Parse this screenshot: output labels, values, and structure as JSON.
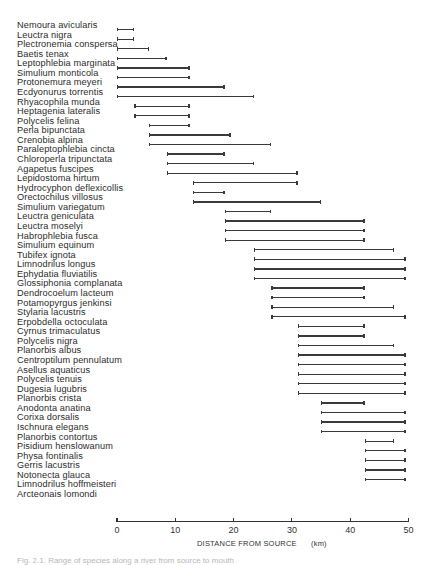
{
  "chart_data": {
    "type": "range-bar",
    "title": "",
    "xlabel": "DISTANCE FROM SOURCE",
    "xunit": "(km)",
    "xlim": [
      0,
      50
    ],
    "xticks": [
      0,
      10,
      20,
      30,
      40,
      50
    ],
    "grid": false,
    "legend": null,
    "series": [
      {
        "name": "Nemoura avicularis",
        "start": 0,
        "end": 3
      },
      {
        "name": "Leuctra nigra",
        "start": 0,
        "end": 3
      },
      {
        "name": "Plectronemia conspersa",
        "start": 0,
        "end": 5.5
      },
      {
        "name": "Baetis tenax",
        "start": 0,
        "end": 8.5
      },
      {
        "name": "Leptophlebia marginata",
        "start": 0,
        "end": 12.5
      },
      {
        "name": "Simulium monticola",
        "start": 0,
        "end": 12.5
      },
      {
        "name": "Protonemura meyeri",
        "start": 0,
        "end": 18.5
      },
      {
        "name": "Ecdyonurus torrentis",
        "start": 0,
        "end": 23.5
      },
      {
        "name": "Rhyacophila munda",
        "start": 3,
        "end": 12.5
      },
      {
        "name": "Heptagenia lateralis",
        "start": 3,
        "end": 12.5
      },
      {
        "name": "Polycelis felina",
        "start": 5.5,
        "end": 12.5
      },
      {
        "name": "Perla bipunctata",
        "start": 5.5,
        "end": 19.5
      },
      {
        "name": "Crenobia alpina",
        "start": 5.5,
        "end": 26.5
      },
      {
        "name": "Paraleptophlebia cincta",
        "start": 8.5,
        "end": 18.5
      },
      {
        "name": "Chloroperla tripunctata",
        "start": 8.5,
        "end": 23.5
      },
      {
        "name": "Agapetus fuscipes",
        "start": 8.5,
        "end": 31
      },
      {
        "name": "Lepidostoma hirtum",
        "start": 13,
        "end": 31
      },
      {
        "name": "Hydrocyphon deflexicollis",
        "start": 13,
        "end": 18.5
      },
      {
        "name": "Orectochilus villosus",
        "start": 13,
        "end": 35
      },
      {
        "name": "Simulium variegatum",
        "start": 18.5,
        "end": 26.5
      },
      {
        "name": "Leuctra geniculata",
        "start": 18.5,
        "end": 42.5
      },
      {
        "name": "Leuctra moselyi",
        "start": 18.5,
        "end": 42.5
      },
      {
        "name": "Habrophlebia fusca",
        "start": 18.5,
        "end": 42.5
      },
      {
        "name": "Simulium equinum",
        "start": 23.5,
        "end": 47.5
      },
      {
        "name": "Tubifex ignota",
        "start": 23.5,
        "end": 49.5
      },
      {
        "name": "Limnodrilus longus",
        "start": 23.5,
        "end": 49.5
      },
      {
        "name": "Ephydatia fluviatilis",
        "start": 23.5,
        "end": 49.5
      },
      {
        "name": "Glossiphonia complanata",
        "start": 26.5,
        "end": 42.5
      },
      {
        "name": "Dendrocoelum lacteum",
        "start": 26.5,
        "end": 42.5
      },
      {
        "name": "Potamopyrgus jenkinsi",
        "start": 26.5,
        "end": 47.5
      },
      {
        "name": "Stylaria lacustris",
        "start": 26.5,
        "end": 49.5
      },
      {
        "name": "Erpobdella octoculata",
        "start": 31,
        "end": 42.5
      },
      {
        "name": "Cyrnus trimaculatus",
        "start": 31,
        "end": 42.5
      },
      {
        "name": "Polycelis nigra",
        "start": 31,
        "end": 47.5
      },
      {
        "name": "Planorbis albus",
        "start": 31,
        "end": 49.5
      },
      {
        "name": "Centroptilum pennulatum",
        "start": 31,
        "end": 49.5
      },
      {
        "name": "Asellus aquaticus",
        "start": 31,
        "end": 49.5
      },
      {
        "name": "Polycelis tenuis",
        "start": 31,
        "end": 49.5
      },
      {
        "name": "Dugesia lugubris",
        "start": 31,
        "end": 49.5
      },
      {
        "name": "Planorbis crista",
        "start": 35,
        "end": 42.5
      },
      {
        "name": "Anodonta anatina",
        "start": 35,
        "end": 49.5
      },
      {
        "name": "Corixa dorsalis",
        "start": 35,
        "end": 49.5
      },
      {
        "name": "Ischnura elegans",
        "start": 35,
        "end": 49.5
      },
      {
        "name": "Planorbis contortus",
        "start": 42.5,
        "end": 47.5
      },
      {
        "name": "Pisidium henslowanum",
        "start": 42.5,
        "end": 49.5
      },
      {
        "name": "Physa fontinalis",
        "start": 42.5,
        "end": 49.5
      },
      {
        "name": "Gerris lacustris",
        "start": 42.5,
        "end": 49.5
      },
      {
        "name": "Notonecta glauca",
        "start": 42.5,
        "end": 49.5
      },
      {
        "name": "Limnodrilus hoffmeisteri",
        "start": null,
        "end": null
      },
      {
        "name": "Arcteonais lomondi",
        "start": null,
        "end": null
      }
    ]
  },
  "caption": "Fig. 2.1. Range of species along a river from source to mouth"
}
